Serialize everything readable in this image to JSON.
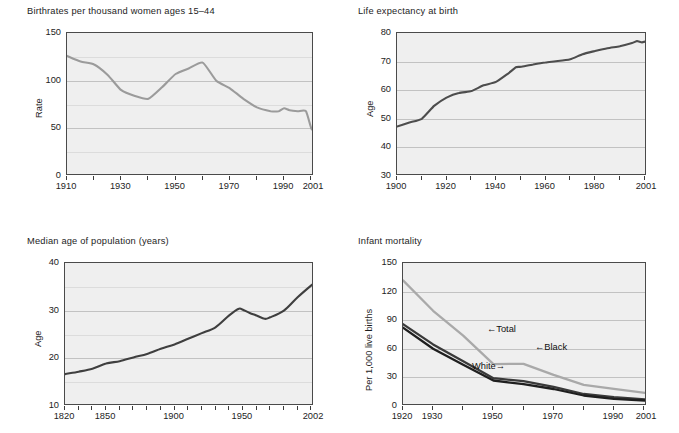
{
  "figure": {
    "background": "#ffffff",
    "plot_background": "#efefef",
    "axis_color": "#4a4a4a",
    "grid_color": "#c2c2c2",
    "dark_series_color": "#4d4d4d",
    "light_series_color": "#a9a9a9",
    "black_series_color": "#2a2a2a"
  },
  "chart_data": [
    {
      "id": "birthrates",
      "type": "line",
      "title": "Birthrates per thousand women ages 15–44",
      "xlabel": "",
      "ylabel": "Rate",
      "xlim": [
        1910,
        2001
      ],
      "ylim": [
        0,
        150
      ],
      "grid": true,
      "legend": "none",
      "line_color": "#9b9b9b",
      "xticks": [
        1910,
        1920,
        1930,
        1940,
        1950,
        1960,
        1970,
        1980,
        1990,
        2000
      ],
      "xtick_labels": [
        "1910",
        "1930",
        "1950",
        "1970",
        "1990",
        "2001"
      ],
      "xtick_label_values": [
        1910,
        1930,
        1950,
        1970,
        1990,
        2001
      ],
      "yticks": [
        0,
        25,
        50,
        75,
        100,
        125,
        150
      ],
      "ytick_labels": [
        "0",
        "50",
        "100",
        "150"
      ],
      "ytick_label_values": [
        0,
        50,
        100,
        150
      ],
      "x": [
        1910,
        1915,
        1920,
        1925,
        1930,
        1935,
        1940,
        1945,
        1950,
        1955,
        1960,
        1965,
        1970,
        1975,
        1980,
        1985,
        1988,
        1990,
        1992,
        1995,
        1998,
        2000,
        2001
      ],
      "values": [
        126,
        120,
        117,
        106,
        90,
        84,
        81,
        93,
        107,
        113,
        119,
        100,
        92,
        81,
        72,
        68,
        68,
        71,
        69,
        68,
        68,
        50,
        48
      ]
    },
    {
      "id": "life-expectancy",
      "type": "line",
      "title": "Life expectancy at birth",
      "xlabel": "",
      "ylabel": "Age",
      "xlim": [
        1900,
        2001
      ],
      "ylim": [
        30,
        80
      ],
      "grid": true,
      "legend": "none",
      "line_color": "#4d4d4d",
      "xticks": [
        1900,
        1910,
        1920,
        1930,
        1940,
        1950,
        1960,
        1970,
        1980,
        1990,
        2000
      ],
      "xtick_labels": [
        "1900",
        "1920",
        "1940",
        "1960",
        "1980",
        "2001"
      ],
      "xtick_label_values": [
        1900,
        1920,
        1940,
        1960,
        1980,
        2001
      ],
      "yticks": [
        30,
        40,
        50,
        60,
        70,
        80
      ],
      "ytick_labels": [
        "30",
        "40",
        "50",
        "60",
        "70",
        "80"
      ],
      "ytick_label_values": [
        30,
        40,
        50,
        60,
        70,
        80
      ],
      "x": [
        1900,
        1905,
        1910,
        1915,
        1920,
        1925,
        1930,
        1935,
        1940,
        1945,
        1948,
        1950,
        1955,
        1960,
        1965,
        1970,
        1975,
        1980,
        1985,
        1990,
        1995,
        1997,
        1999,
        2001
      ],
      "values": [
        47.3,
        48.7,
        50.0,
        54.5,
        57.4,
        59.0,
        59.7,
        61.7,
        62.9,
        65.9,
        68.0,
        68.2,
        69.0,
        69.7,
        70.2,
        70.8,
        72.6,
        73.7,
        74.7,
        75.4,
        76.5,
        77.2,
        76.7,
        77.2
      ]
    },
    {
      "id": "median-age",
      "type": "line",
      "title": "Median age of population (years)",
      "xlabel": "",
      "ylabel": "Age",
      "xlim": [
        1820,
        2002
      ],
      "ylim": [
        10,
        40
      ],
      "grid": true,
      "legend": "none",
      "line_color": "#3f3f3f",
      "xticks": [
        1820,
        1830,
        1840,
        1850,
        1860,
        1870,
        1880,
        1890,
        1900,
        1910,
        1920,
        1930,
        1940,
        1950,
        1960,
        1970,
        1980,
        1990,
        2000
      ],
      "xtick_labels": [
        "1820",
        "1850",
        "1900",
        "1950",
        "2002"
      ],
      "xtick_label_values": [
        1820,
        1850,
        1900,
        1950,
        2002
      ],
      "yticks": [
        10,
        15,
        20,
        25,
        30,
        35,
        40
      ],
      "ytick_labels": [
        "10",
        "20",
        "30",
        "40"
      ],
      "ytick_label_values": [
        10,
        20,
        30,
        40
      ],
      "x": [
        1820,
        1830,
        1840,
        1850,
        1860,
        1870,
        1880,
        1890,
        1900,
        1910,
        1920,
        1930,
        1940,
        1947,
        1950,
        1955,
        1960,
        1966,
        1970,
        1980,
        1990,
        2000,
        2002
      ],
      "values": [
        16.7,
        17.2,
        17.8,
        18.9,
        19.4,
        20.2,
        20.9,
        22.0,
        22.9,
        24.1,
        25.3,
        26.5,
        29.0,
        30.4,
        30.2,
        29.5,
        29.0,
        28.3,
        28.6,
        30.0,
        32.8,
        35.3,
        35.7
      ]
    },
    {
      "id": "infant-mortality",
      "type": "line",
      "title": "Infant mortality",
      "xlabel": "",
      "ylabel": "Per 1,000 live births",
      "xlim": [
        1920,
        2001
      ],
      "ylim": [
        0,
        150
      ],
      "grid": true,
      "legend": "inline-annotations",
      "xticks": [
        1920,
        1930,
        1940,
        1950,
        1960,
        1970,
        1980,
        1990,
        2000
      ],
      "xtick_labels": [
        "1920",
        "1930",
        "1950",
        "1970",
        "1990",
        "2001"
      ],
      "xtick_label_values": [
        1920,
        1930,
        1950,
        1970,
        1990,
        2001
      ],
      "yticks": [
        0,
        30,
        60,
        90,
        120,
        150
      ],
      "ytick_labels": [
        "0",
        "30",
        "60",
        "90",
        "120",
        "150"
      ],
      "ytick_label_values": [
        0,
        30,
        60,
        90,
        120,
        150
      ],
      "x": [
        1920,
        1930,
        1940,
        1950,
        1960,
        1970,
        1980,
        1990,
        2001
      ],
      "series": [
        {
          "name": "Black",
          "color": "#a9a9a9",
          "values": [
            131.7,
            99.9,
            73.8,
            43.9,
            44.3,
            32.6,
            22.2,
            18.0,
            13.5
          ]
        },
        {
          "name": "Total",
          "color": "#3a3a3a",
          "values": [
            85.8,
            64.6,
            47.0,
            29.2,
            26.0,
            20.0,
            12.6,
            9.2,
            6.8
          ]
        },
        {
          "name": "White",
          "color": "#1f1f1f",
          "values": [
            82.1,
            60.1,
            43.2,
            26.8,
            22.9,
            17.8,
            11.0,
            7.6,
            5.7
          ]
        }
      ],
      "annotations": [
        {
          "label": "←Total",
          "series": "Total"
        },
        {
          "label": "←Black",
          "series": "Black"
        },
        {
          "label": "White→",
          "series": "White"
        }
      ]
    }
  ]
}
